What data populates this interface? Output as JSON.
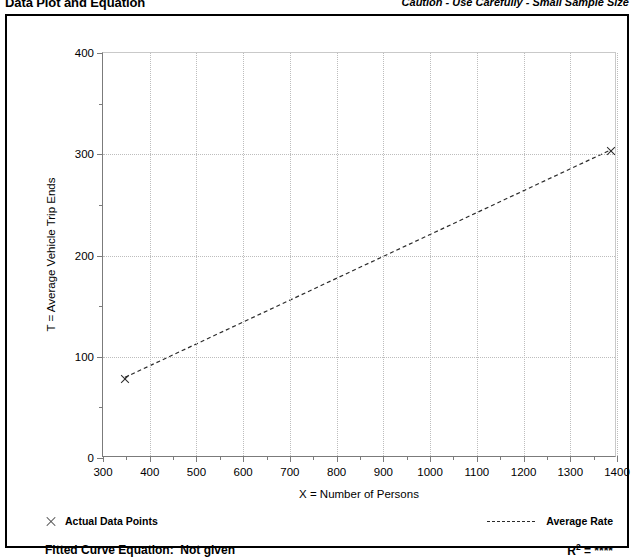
{
  "header": {
    "title": "Data Plot and Equation",
    "caution": "Caution - Use Carefully - Small Sample Size"
  },
  "legend": {
    "data_points_label": "Actual Data Points",
    "average_rate_label": "Average Rate",
    "data_points_marker": "x-cross-marker",
    "average_rate_marker": "dashed-line"
  },
  "footer": {
    "equation_label": "Fitted Curve Equation:",
    "equation_value": "Not given",
    "rsq_prefix": "R",
    "rsq_exponent": "2",
    "rsq_value": "= ****"
  },
  "chart_data": {
    "type": "scatter",
    "title": "Data Plot and Equation",
    "xlabel": "X = Number of Persons",
    "ylabel": "T = Average Vehicle Trip Ends",
    "xlim": [
      300,
      1400
    ],
    "ylim": [
      0,
      400
    ],
    "xticks": [
      300,
      400,
      500,
      600,
      700,
      800,
      900,
      1000,
      1100,
      1200,
      1300,
      1400
    ],
    "yticks": [
      0,
      100,
      200,
      300,
      400
    ],
    "x_minor_step": 50,
    "y_minor_step": 50,
    "grid": true,
    "legend_position": "below-plot",
    "series": [
      {
        "name": "Actual Data Points",
        "type": "scatter",
        "marker": "x",
        "points": [
          {
            "x": 347,
            "y": 78
          },
          {
            "x": 1387,
            "y": 303
          }
        ]
      },
      {
        "name": "Average Rate",
        "type": "line",
        "style": "dashed",
        "points": [
          {
            "x": 347,
            "y": 78
          },
          {
            "x": 1387,
            "y": 303
          }
        ]
      }
    ],
    "annotations": {
      "caution": "Caution - Use Carefully - Small Sample Size",
      "fitted_curve_equation": "Not given",
      "r_squared": "****"
    }
  }
}
